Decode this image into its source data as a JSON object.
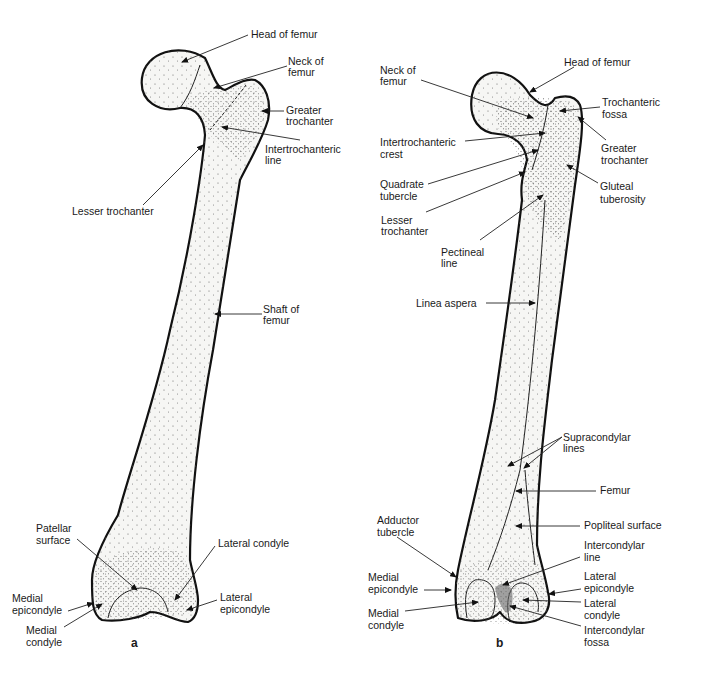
{
  "figure": {
    "panels": [
      {
        "id": "a",
        "label": "a",
        "view": "anterior",
        "annotations": [
          {
            "key": "head",
            "lines": [
              "Head of femur"
            ]
          },
          {
            "key": "neck",
            "lines": [
              "Neck of",
              "femur"
            ]
          },
          {
            "key": "greater_trochanter",
            "lines": [
              "Greater",
              "trochanter"
            ]
          },
          {
            "key": "intertrochanteric_line",
            "lines": [
              "Intertrochanteric",
              "line"
            ]
          },
          {
            "key": "lesser_trochanter",
            "lines": [
              "Lesser trochanter"
            ]
          },
          {
            "key": "shaft",
            "lines": [
              "Shaft of",
              "femur"
            ]
          },
          {
            "key": "patellar_surface",
            "lines": [
              "Patellar",
              "surface"
            ]
          },
          {
            "key": "lateral_condyle",
            "lines": [
              "Lateral condyle"
            ]
          },
          {
            "key": "medial_epicondyle",
            "lines": [
              "Medial",
              "epicondyle"
            ]
          },
          {
            "key": "medial_condyle",
            "lines": [
              "Medial",
              "condyle"
            ]
          },
          {
            "key": "lateral_epicondyle",
            "lines": [
              "Lateral",
              "epicondyle"
            ]
          }
        ]
      },
      {
        "id": "b",
        "label": "b",
        "view": "posterior",
        "annotations": [
          {
            "key": "neck",
            "lines": [
              "Neck of",
              "femur"
            ]
          },
          {
            "key": "head",
            "lines": [
              "Head of femur"
            ]
          },
          {
            "key": "trochanteric_fossa",
            "lines": [
              "Trochanteric",
              "fossa"
            ]
          },
          {
            "key": "intertrochanteric_crest",
            "lines": [
              "Intertrochanteric",
              "crest"
            ]
          },
          {
            "key": "greater_trochanter",
            "lines": [
              "Greater",
              "trochanter"
            ]
          },
          {
            "key": "quadrate_tubercle",
            "lines": [
              "Quadrate",
              "tubercle"
            ]
          },
          {
            "key": "gluteal_tuberosity",
            "lines": [
              "Gluteal",
              "tuberosity"
            ]
          },
          {
            "key": "lesser_trochanter",
            "lines": [
              "Lesser",
              "trochanter"
            ]
          },
          {
            "key": "pectineal_line",
            "lines": [
              "Pectineal",
              "line"
            ]
          },
          {
            "key": "linea_aspera",
            "lines": [
              "Linea aspera"
            ]
          },
          {
            "key": "supracondylar_lines",
            "lines": [
              "Supracondylar",
              "lines"
            ]
          },
          {
            "key": "femur",
            "lines": [
              "Femur"
            ]
          },
          {
            "key": "adductor_tubercle",
            "lines": [
              "Adductor",
              "tubercle"
            ]
          },
          {
            "key": "popliteal_surface",
            "lines": [
              "Popliteal surface"
            ]
          },
          {
            "key": "intercondylar_line",
            "lines": [
              "Intercondylar",
              "line"
            ]
          },
          {
            "key": "medial_epicondyle",
            "lines": [
              "Medial",
              "epicondyle"
            ]
          },
          {
            "key": "lateral_epicondyle",
            "lines": [
              "Lateral",
              "epicondyle"
            ]
          },
          {
            "key": "medial_condyle",
            "lines": [
              "Medial",
              "condyle"
            ]
          },
          {
            "key": "lateral_condyle",
            "lines": [
              "Lateral",
              "condyle"
            ]
          },
          {
            "key": "intercondylar_fossa",
            "lines": [
              "Intercondylar",
              "fossa"
            ]
          }
        ]
      }
    ]
  }
}
